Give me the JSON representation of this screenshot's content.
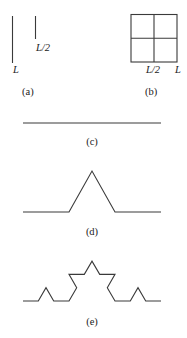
{
  "panels": {
    "a": {
      "caption": "(a)",
      "long_label": "L",
      "short_label": "L/2",
      "long_line": {
        "x": 12.5,
        "y1": 16,
        "y2": 63
      },
      "short_line": {
        "x": 35.5,
        "y1": 16,
        "y2": 39
      }
    },
    "b": {
      "caption": "(b)",
      "mid_label": "L/2",
      "end_label": "L",
      "square": {
        "x": 131,
        "y": 14.5,
        "w": 46,
        "h": 47.5
      }
    },
    "c": {
      "caption": "(c)",
      "points": "23,123 161,123"
    },
    "d": {
      "caption": "(d)",
      "points": "23,212 69,212 92,171 115,212 161,212"
    },
    "e": {
      "caption": "(e)",
      "points": "23,301 38.3,301 46,287.7 53.7,301 69,301 76.7,287.7 69,274.4 84.3,274.4 92,261.2 99.7,274.4 115,274.4 107.3,287.7 115,301 130.3,301 138,287.7 145.7,301 161,301"
    }
  },
  "colors": {
    "stroke": "#3a3a3a",
    "background": "#ffffff"
  }
}
